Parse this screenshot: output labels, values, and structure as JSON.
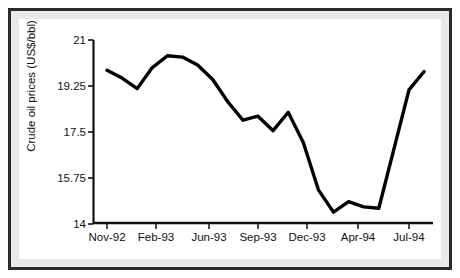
{
  "chart_data": {
    "type": "line",
    "title": "",
    "subtitle": "",
    "xlabel": "",
    "ylabel": "Crude oil prices (US$/bbl)",
    "ylim": [
      14,
      21
    ],
    "ytick_labels": [
      "21",
      "19.25",
      "17.5",
      "15.75",
      "14"
    ],
    "ytick_values": [
      21,
      19.25,
      17.5,
      15.75,
      14
    ],
    "xtick_labels": [
      "Nov-92",
      "Feb-93",
      "Jun-93",
      "Sep-93",
      "Dec-93",
      "Apr-94",
      "Jul-94"
    ],
    "grid": false,
    "legend": "none",
    "series": [
      {
        "name": "Crude oil prices",
        "color": "#000000",
        "x": [
          "Nov-92",
          "Dec-92",
          "Jan-93",
          "Feb-93",
          "Mar-93",
          "Apr-93",
          "May-93",
          "Jun-93",
          "Jul-93",
          "Aug-93",
          "Sep-93",
          "Oct-93",
          "Nov-93",
          "Dec-93",
          "Jan-94",
          "Feb-94",
          "Mar-94",
          "Apr-94",
          "May-94",
          "Jun-94",
          "Jul-94",
          "Aug-94"
        ],
        "values": [
          19.85,
          19.55,
          19.15,
          19.95,
          20.4,
          20.35,
          20.05,
          19.5,
          18.65,
          17.95,
          18.1,
          17.55,
          18.25,
          17.1,
          15.3,
          14.45,
          14.85,
          14.65,
          14.6,
          16.85,
          19.1,
          19.8
        ]
      }
    ]
  }
}
